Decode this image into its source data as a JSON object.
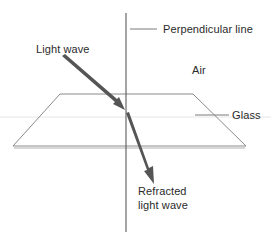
{
  "diagram": {
    "labels": {
      "perpendicular": "Perpendicular line",
      "incident": "Light wave",
      "medium_top": "Air",
      "medium_bottom": "Glass",
      "refracted_line1": "Refracted",
      "refracted_line2": "light wave"
    },
    "colors": {
      "line": "#555555",
      "arrow": "#555555",
      "plane": "#8a8a8a",
      "text": "#2a2a2a"
    }
  }
}
